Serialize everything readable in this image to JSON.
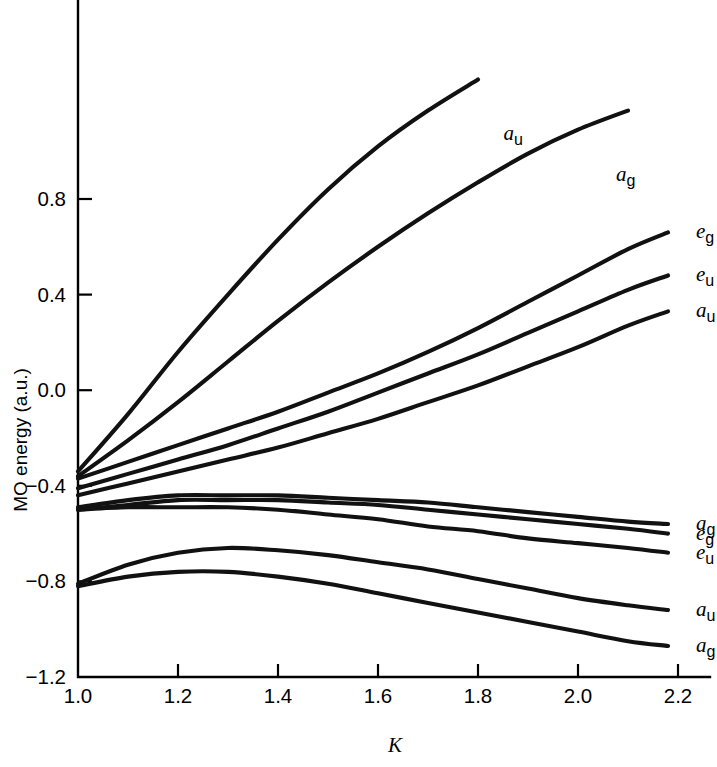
{
  "chart_data": {
    "type": "line",
    "title": "",
    "xlabel": "K",
    "ylabel": "MO energy (a.u.)",
    "xlim": [
      1.0,
      2.2
    ],
    "ylim": [
      -1.2,
      1.0
    ],
    "grid": false,
    "legend_position": "inline-right-labels",
    "xticks": [
      "1.0",
      "1.2",
      "1.4",
      "1.6",
      "1.8",
      "2.0",
      "2.2"
    ],
    "xtick_values": [
      1.0,
      1.2,
      1.4,
      1.6,
      1.8,
      2.0,
      2.2
    ],
    "yticks": [
      "0.8",
      "0.4",
      "0.0",
      "−0.4",
      "−0.8",
      "−1.2"
    ],
    "ytick_values": [
      0.8,
      0.4,
      0.0,
      -0.4,
      -0.8,
      -1.2
    ],
    "x": [
      1.0,
      1.1,
      1.2,
      1.3,
      1.4,
      1.5,
      1.6,
      1.7,
      1.8,
      1.9,
      2.0,
      2.1,
      2.18
    ],
    "series": [
      {
        "name": "a_u (upper)",
        "label_letter": "a",
        "label_sub": "u",
        "label_x": 1.835,
        "label_y": 1.07,
        "values": [
          -0.34,
          -0.1,
          0.16,
          0.4,
          0.63,
          0.84,
          1.02,
          1.17,
          1.3,
          null,
          null,
          null,
          null
        ]
      },
      {
        "name": "a_g (upper)",
        "label_letter": "a",
        "label_sub": "g",
        "label_x": 2.06,
        "label_y": 0.9,
        "values": [
          -0.36,
          -0.21,
          -0.05,
          0.12,
          0.29,
          0.45,
          0.6,
          0.74,
          0.87,
          0.99,
          1.09,
          1.17,
          null
        ]
      },
      {
        "name": "e_g (middle)",
        "label_letter": "e",
        "label_sub": "g",
        "label_x": 2.22,
        "label_y": 0.66,
        "values": [
          -0.37,
          -0.3,
          -0.23,
          -0.16,
          -0.09,
          -0.01,
          0.07,
          0.16,
          0.26,
          0.37,
          0.48,
          0.59,
          0.66
        ]
      },
      {
        "name": "e_u (middle)",
        "label_letter": "e",
        "label_sub": "u",
        "label_x": 2.22,
        "label_y": 0.48,
        "values": [
          -0.41,
          -0.35,
          -0.29,
          -0.23,
          -0.16,
          -0.09,
          -0.01,
          0.07,
          0.15,
          0.24,
          0.33,
          0.42,
          0.48
        ]
      },
      {
        "name": "a_u (middle)",
        "label_letter": "a",
        "label_sub": "u",
        "label_x": 2.22,
        "label_y": 0.33,
        "values": [
          -0.44,
          -0.39,
          -0.34,
          -0.29,
          -0.24,
          -0.18,
          -0.12,
          -0.05,
          0.02,
          0.1,
          0.18,
          0.27,
          0.33
        ]
      },
      {
        "name": "a_g (lower cluster, top)",
        "label_letter": "a",
        "label_sub": "g",
        "label_x": 2.22,
        "label_y": -0.56,
        "values": [
          -0.49,
          -0.46,
          -0.44,
          -0.44,
          -0.44,
          -0.45,
          -0.46,
          -0.47,
          -0.49,
          -0.51,
          -0.53,
          -0.55,
          -0.56
        ]
      },
      {
        "name": "e_g (lower cluster, middle)",
        "label_letter": "e",
        "label_sub": "g",
        "label_x": 2.22,
        "label_y": -0.6,
        "values": [
          -0.5,
          -0.48,
          -0.46,
          -0.46,
          -0.46,
          -0.47,
          -0.48,
          -0.5,
          -0.52,
          -0.54,
          -0.56,
          -0.58,
          -0.6
        ]
      },
      {
        "name": "e_u (lower cluster, bottom)",
        "label_letter": "e",
        "label_sub": "u",
        "label_x": 2.22,
        "label_y": -0.68,
        "values": [
          -0.5,
          -0.49,
          -0.49,
          -0.49,
          -0.5,
          -0.52,
          -0.54,
          -0.57,
          -0.59,
          -0.62,
          -0.64,
          -0.66,
          -0.68
        ]
      },
      {
        "name": "a_u (bottom)",
        "label_letter": "a",
        "label_sub": "u",
        "label_x": 2.22,
        "label_y": -0.92,
        "values": [
          -0.81,
          -0.73,
          -0.68,
          -0.66,
          -0.67,
          -0.69,
          -0.72,
          -0.75,
          -0.79,
          -0.83,
          -0.87,
          -0.9,
          -0.92
        ]
      },
      {
        "name": "a_g (bottom)",
        "label_letter": "a",
        "label_sub": "g",
        "label_x": 2.22,
        "label_y": -1.07,
        "values": [
          -0.82,
          -0.78,
          -0.76,
          -0.76,
          -0.78,
          -0.81,
          -0.85,
          -0.89,
          -0.93,
          -0.97,
          -1.01,
          -1.05,
          -1.07
        ]
      }
    ]
  }
}
